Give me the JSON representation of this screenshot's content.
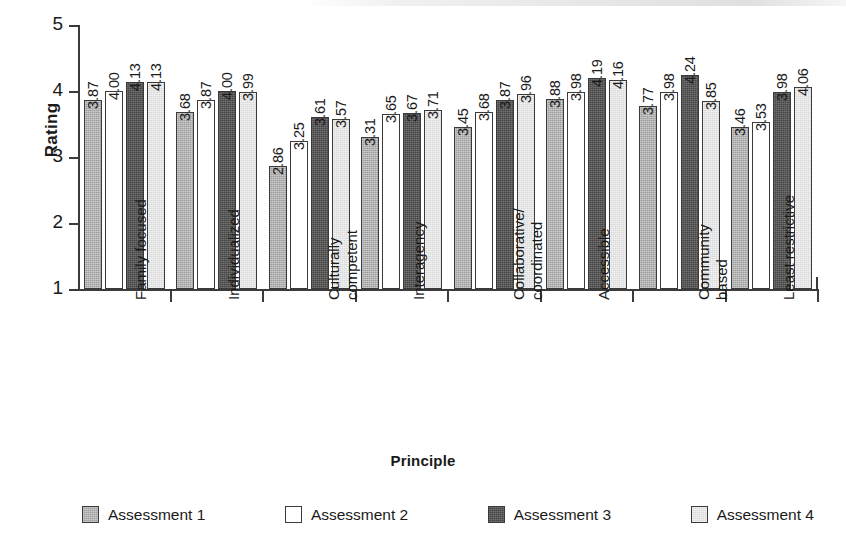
{
  "chart_data": {
    "type": "bar",
    "title": "",
    "xlabel": "Principle",
    "ylabel": "Rating",
    "ylim": [
      1,
      5
    ],
    "yticks": [
      "1",
      "2",
      "3",
      "4",
      "5"
    ],
    "grid": false,
    "legend_position": "bottom",
    "value_labels": true,
    "categories": [
      "Family focused",
      "Individualized",
      "Culturally competent",
      "Interagency",
      "Collaborative/ coordinated",
      "Accessible",
      "Community based",
      "Least restrictive"
    ],
    "category_lines": [
      [
        "Family focused",
        ""
      ],
      [
        "Individualized",
        ""
      ],
      [
        "Culturally",
        "competent"
      ],
      [
        "Interagency",
        ""
      ],
      [
        "Collaborative/",
        "coordinated"
      ],
      [
        "Accessible",
        ""
      ],
      [
        "Community",
        "based"
      ],
      [
        "Least restrictive",
        ""
      ]
    ],
    "series": [
      {
        "name": "Assessment 1",
        "color": "#9d9d9d",
        "values": [
          3.87,
          3.68,
          2.86,
          3.31,
          3.45,
          3.88,
          3.77,
          3.46
        ],
        "labels": [
          "3.87",
          "3.68",
          "2.86",
          "3.31",
          "3.45",
          "3.88",
          "3.77",
          "3.46"
        ]
      },
      {
        "name": "Assessment 2",
        "color": "#ffffff",
        "values": [
          4.0,
          3.87,
          3.25,
          3.65,
          3.68,
          3.98,
          3.98,
          3.53
        ],
        "labels": [
          "4.00",
          "3.87",
          "3.25",
          "3.65",
          "3.68",
          "3.98",
          "3.98",
          "3.53"
        ]
      },
      {
        "name": "Assessment 3",
        "color": "#454545",
        "values": [
          4.13,
          4.0,
          3.61,
          3.67,
          3.87,
          4.19,
          4.24,
          3.98
        ],
        "labels": [
          "4.13",
          "4.00",
          "3.61",
          "3.67",
          "3.87",
          "4.19",
          "4.24",
          "3.98"
        ]
      },
      {
        "name": "Assessment 4",
        "color": "#d9d9d9",
        "values": [
          4.13,
          3.99,
          3.57,
          3.71,
          3.96,
          4.16,
          3.85,
          4.06
        ],
        "labels": [
          "4.13",
          "3.99",
          "3.57",
          "3.71",
          "3.96",
          "4.16",
          "3.85",
          "4.06"
        ]
      }
    ]
  },
  "axes": {
    "y_title": "Rating",
    "x_title": "Principle"
  }
}
